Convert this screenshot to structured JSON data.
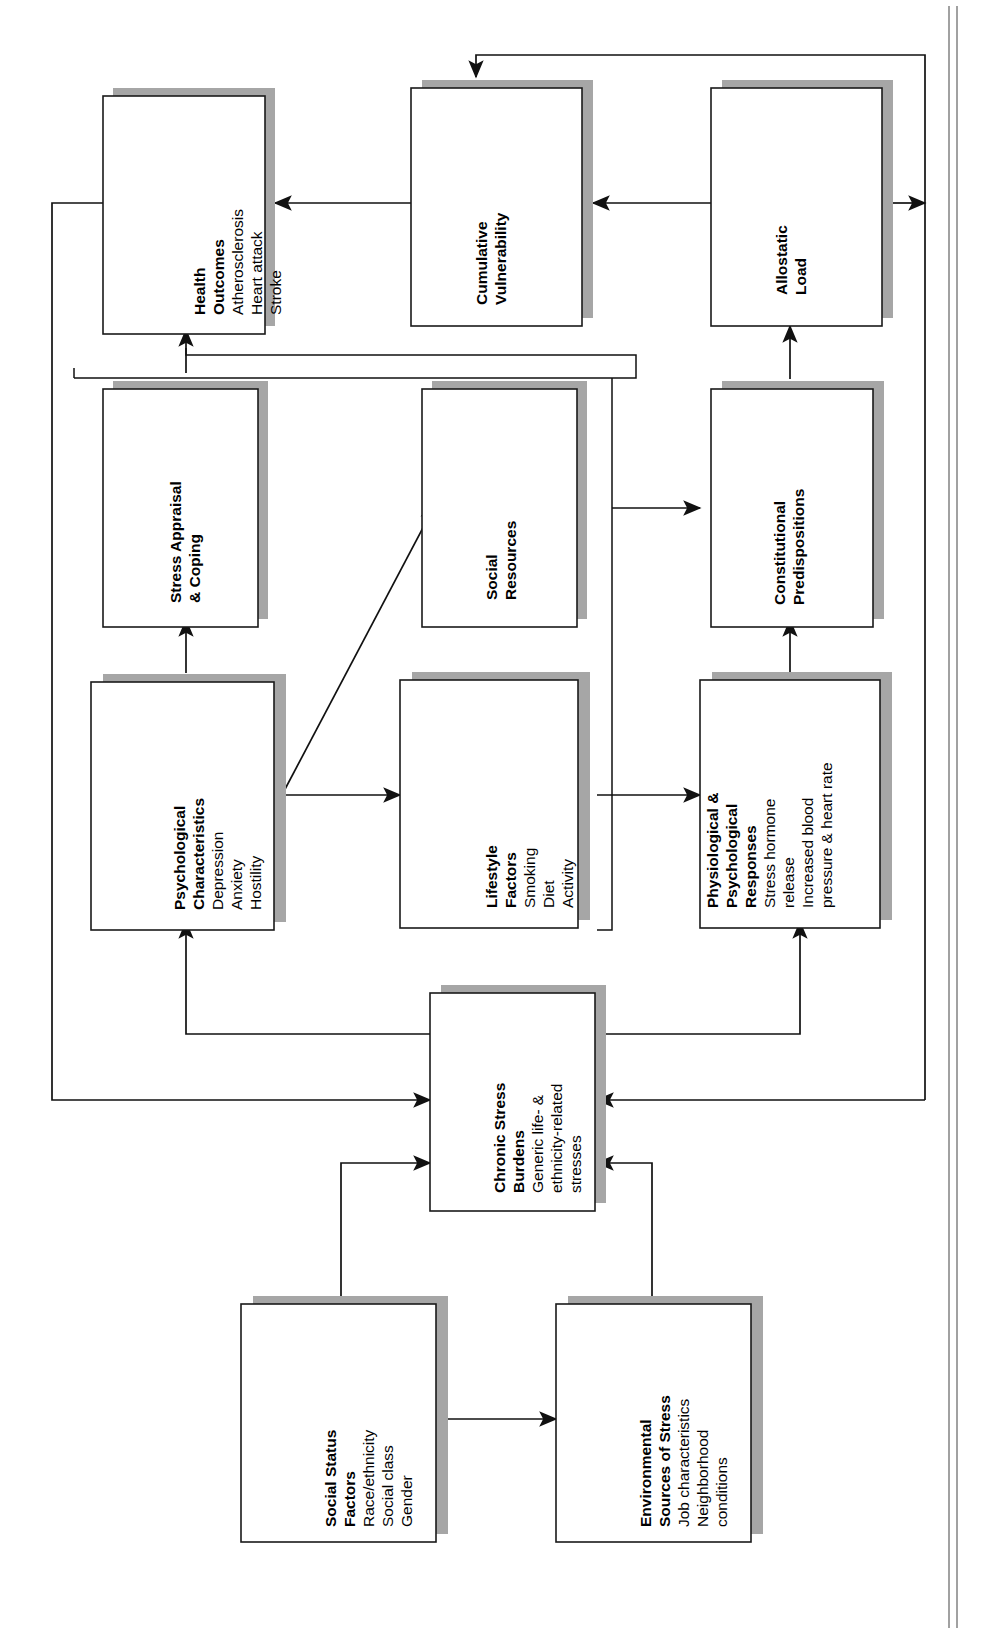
{
  "diagram": {
    "orientation": "rotated-90-counterclockwise",
    "colors": {
      "box_fill": "#ffffff",
      "box_stroke": "#1a1a1a",
      "box_shadow": "#a6a6a6",
      "connector": "#111111",
      "page_background": "#ffffff"
    },
    "nodes": [
      {
        "id": "health-outcomes",
        "heading": [
          "Health",
          "Outcomes"
        ],
        "items": [
          "Atherosclerosis",
          "Heart attack",
          "Stroke"
        ]
      },
      {
        "id": "cumulative-vulnerability",
        "heading": [
          "Cumulative",
          "Vulnerability"
        ],
        "items": []
      },
      {
        "id": "allostatic-load",
        "heading": [
          "Allostatic",
          "Load"
        ],
        "items": []
      },
      {
        "id": "stress-appraisal-coping",
        "heading": [
          "Stress Appraisal",
          "& Coping"
        ],
        "items": []
      },
      {
        "id": "social-resources",
        "heading": [
          "Social",
          "Resources"
        ],
        "items": []
      },
      {
        "id": "constitutional-predispositions",
        "heading": [
          "Constitutional",
          "Predispositions"
        ],
        "items": []
      },
      {
        "id": "psychological-characteristics",
        "heading": [
          "Psychological",
          "Characteristics"
        ],
        "items": [
          "Depression",
          "Anxiety",
          "Hostility"
        ]
      },
      {
        "id": "lifestyle-factors",
        "heading": [
          "Lifestyle",
          "Factors"
        ],
        "items": [
          "Smoking",
          "Diet",
          "Activity"
        ]
      },
      {
        "id": "physiological-psychological-responses",
        "heading": [
          "Physiological &",
          "Psychological",
          "Responses"
        ],
        "items": [
          "Stress hormone",
          "release",
          "Increased blood",
          "pressure & heart rate"
        ]
      },
      {
        "id": "chronic-stress-burdens",
        "heading": [
          "Chronic Stress",
          "Burdens"
        ],
        "items": [
          "Generic life- &",
          "ethnicity-related",
          "stresses"
        ]
      },
      {
        "id": "social-status-factors",
        "heading": [
          "Social Status",
          "Factors"
        ],
        "items": [
          "Race/ethnicity",
          "Social class",
          "Gender"
        ]
      },
      {
        "id": "environmental-sources-of-stress",
        "heading": [
          "Environmental",
          "Sources of Stress"
        ],
        "items": [
          "Job characteristics",
          "Neighborhood",
          "conditions"
        ]
      }
    ],
    "edges": [
      {
        "from": "social-status-factors",
        "to": "environmental-sources-of-stress"
      },
      {
        "from": "social-status-factors",
        "to": "chronic-stress-burdens"
      },
      {
        "from": "environmental-sources-of-stress",
        "to": "chronic-stress-burdens"
      },
      {
        "from": "chronic-stress-burdens",
        "to": "psychological-characteristics"
      },
      {
        "from": "chronic-stress-burdens",
        "to": "physiological-psychological-responses"
      },
      {
        "from": "psychological-characteristics",
        "to": "stress-appraisal-coping"
      },
      {
        "from": "psychological-characteristics",
        "to": "lifestyle-factors"
      },
      {
        "from": "psychological-characteristics",
        "to": "social-resources"
      },
      {
        "from": "lifestyle-factors",
        "to": "physiological-psychological-responses"
      },
      {
        "from": "social-resources",
        "to": "constitutional-predispositions"
      },
      {
        "from": "physiological-psychological-responses",
        "to": "constitutional-predispositions"
      },
      {
        "from": "constitutional-predispositions",
        "to": "allostatic-load"
      },
      {
        "from": "allostatic-load",
        "to": "cumulative-vulnerability"
      },
      {
        "from": "cumulative-vulnerability",
        "to": "health-outcomes"
      },
      {
        "from": "stress-appraisal-coping",
        "to": "health-outcomes"
      },
      {
        "from": "health-outcomes",
        "to": "chronic-stress-burdens"
      },
      {
        "from": "allostatic-load",
        "to": "chronic-stress-burdens"
      }
    ]
  }
}
